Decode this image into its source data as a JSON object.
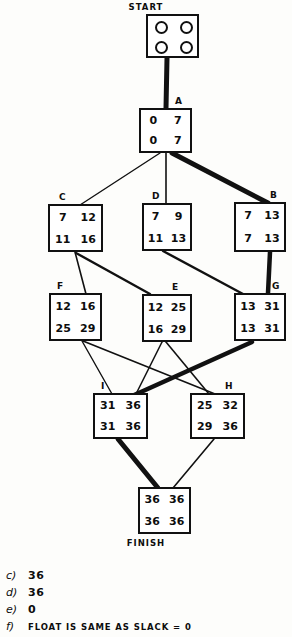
{
  "diagram": {
    "title_caption": "START",
    "finish_caption": "FINISH",
    "nodes": [
      {
        "id": "start",
        "label": "START",
        "es": "",
        "ef": "",
        "ls": "",
        "lf": "",
        "x": 146,
        "y": 14,
        "w": 53,
        "h": 44,
        "circles": true,
        "critical": true
      },
      {
        "id": "A",
        "label": "A",
        "es": "0",
        "ef": "7",
        "ls": "0",
        "lf": "7",
        "x": 139,
        "y": 108,
        "w": 53,
        "h": 45,
        "circles": false,
        "critical": true
      },
      {
        "id": "C",
        "label": "C",
        "es": "7",
        "ef": "12",
        "ls": "11",
        "lf": "16",
        "x": 48,
        "y": 204,
        "w": 55,
        "h": 48,
        "circles": false,
        "critical": false
      },
      {
        "id": "D",
        "label": "D",
        "es": "7",
        "ef": "9",
        "ls": "11",
        "lf": "13",
        "x": 142,
        "y": 203,
        "w": 50,
        "h": 48,
        "circles": false,
        "critical": false
      },
      {
        "id": "B",
        "label": "B",
        "es": "7",
        "ef": "13",
        "ls": "7",
        "lf": "13",
        "x": 234,
        "y": 202,
        "w": 52,
        "h": 50,
        "circles": false,
        "critical": true
      },
      {
        "id": "F",
        "label": "F",
        "es": "12",
        "ef": "16",
        "ls": "25",
        "lf": "29",
        "x": 49,
        "y": 293,
        "w": 53,
        "h": 48,
        "circles": false,
        "critical": false
      },
      {
        "id": "E",
        "label": "E",
        "es": "12",
        "ef": "25",
        "ls": "16",
        "lf": "29",
        "x": 142,
        "y": 294,
        "w": 50,
        "h": 48,
        "circles": false,
        "critical": false
      },
      {
        "id": "G",
        "label": "G",
        "es": "13",
        "ef": "31",
        "ls": "13",
        "lf": "31",
        "x": 234,
        "y": 293,
        "w": 52,
        "h": 48,
        "circles": false,
        "critical": true
      },
      {
        "id": "I",
        "label": "I",
        "es": "31",
        "ef": "36",
        "ls": "31",
        "lf": "36",
        "x": 93,
        "y": 393,
        "w": 55,
        "h": 46,
        "circles": false,
        "critical": true
      },
      {
        "id": "H",
        "label": "H",
        "es": "25",
        "ef": "32",
        "ls": "29",
        "lf": "36",
        "x": 190,
        "y": 393,
        "w": 55,
        "h": 46,
        "circles": false,
        "critical": false
      },
      {
        "id": "finish",
        "label": "",
        "es": "36",
        "ef": "36",
        "ls": "36",
        "lf": "36",
        "x": 138,
        "y": 487,
        "w": 53,
        "h": 47,
        "circles": false,
        "critical": true
      }
    ],
    "edges": [
      {
        "from": "start",
        "to": "A",
        "critical": true
      },
      {
        "from": "A",
        "to": "C",
        "critical": false
      },
      {
        "from": "A",
        "to": "D",
        "critical": false
      },
      {
        "from": "A",
        "to": "B",
        "critical": true
      },
      {
        "from": "C",
        "to": "F",
        "critical": false
      },
      {
        "from": "C",
        "to": "E",
        "critical": false
      },
      {
        "from": "D",
        "to": "G",
        "critical": false
      },
      {
        "from": "B",
        "to": "G",
        "critical": true
      },
      {
        "from": "F",
        "to": "I",
        "critical": false
      },
      {
        "from": "F",
        "to": "H",
        "critical": false
      },
      {
        "from": "E",
        "to": "I",
        "critical": false
      },
      {
        "from": "E",
        "to": "H",
        "critical": false
      },
      {
        "from": "G",
        "to": "I",
        "critical": true
      },
      {
        "from": "I",
        "to": "finish",
        "critical": true
      },
      {
        "from": "H",
        "to": "finish",
        "critical": false
      }
    ],
    "colors": {
      "ink": "#111111",
      "paper": "#fdfdfb"
    }
  },
  "answers": [
    {
      "key": "c)",
      "value": "36"
    },
    {
      "key": "d)",
      "value": "36"
    },
    {
      "key": "e)",
      "value": "0"
    },
    {
      "key": "f)",
      "value": "FLOAT IS SAME AS SLACK = 0"
    }
  ]
}
